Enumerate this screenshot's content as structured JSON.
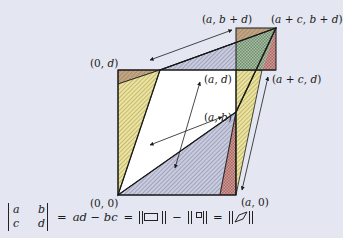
{
  "figure": {
    "colors": {
      "background": "#e4e6f1",
      "white_parallelogram": "#ffffff",
      "brown_triangle": "#b79a78",
      "yellow_triangle": "#e9e19a",
      "blue_hatched_triangle": "#b9bdd3",
      "green_checked_triangle": "#9fb79c",
      "red_triangle": "#c98b86",
      "outline": "#1a1a1a"
    },
    "points": {
      "origin": "(0, 0)",
      "a0": "(a, 0)",
      "zero_d": "(0, d)",
      "ad": "(a, d)",
      "ab": "(a, b)",
      "acd": "(a + c, d)",
      "abd": "(a, b + d)",
      "acbd": "(a + c, b + d)"
    }
  },
  "formula": {
    "matrix": [
      "a",
      "b",
      "c",
      "d"
    ],
    "equals1": "=",
    "expr": "ad − bc",
    "equals2": "=",
    "minus": "−",
    "equals3": "=",
    "norm_large_rect_icon": "rectangle-icon",
    "norm_small_rect_icon": "small-rectangle-icon",
    "norm_parallelogram_icon": "parallelogram-icon"
  }
}
